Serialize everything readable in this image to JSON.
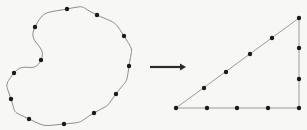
{
  "figure": {
    "source_shape": {
      "type": "closed-curve",
      "points": [
        [
          67,
          9
        ],
        [
          97,
          15
        ],
        [
          124,
          36
        ],
        [
          129,
          66
        ],
        [
          116,
          94
        ],
        [
          94,
          113
        ],
        [
          64,
          124
        ],
        [
          29,
          119
        ],
        [
          11,
          99
        ],
        [
          14,
          73
        ],
        [
          41,
          60
        ],
        [
          35,
          27
        ]
      ]
    },
    "arrow": {
      "from": [
        150,
        67
      ],
      "to": [
        186,
        67
      ],
      "direction": "right"
    },
    "target_shape": {
      "type": "right-triangle",
      "vertices": [
        [
          176,
          108
        ],
        [
          299,
          18
        ],
        [
          299,
          108
        ]
      ],
      "points": [
        [
          176,
          108
        ],
        [
          204,
          88
        ],
        [
          226,
          72
        ],
        [
          250,
          54
        ],
        [
          272,
          38
        ],
        [
          299,
          18
        ],
        [
          299,
          48
        ],
        [
          299,
          79
        ],
        [
          299,
          108
        ],
        [
          268,
          108
        ],
        [
          237,
          108
        ],
        [
          207,
          108
        ]
      ]
    },
    "colors": {
      "background": "#f7f7f5",
      "line": "#8a8a8a",
      "dot": "#1a1a1a",
      "arrow": "#2a2a2a"
    }
  }
}
